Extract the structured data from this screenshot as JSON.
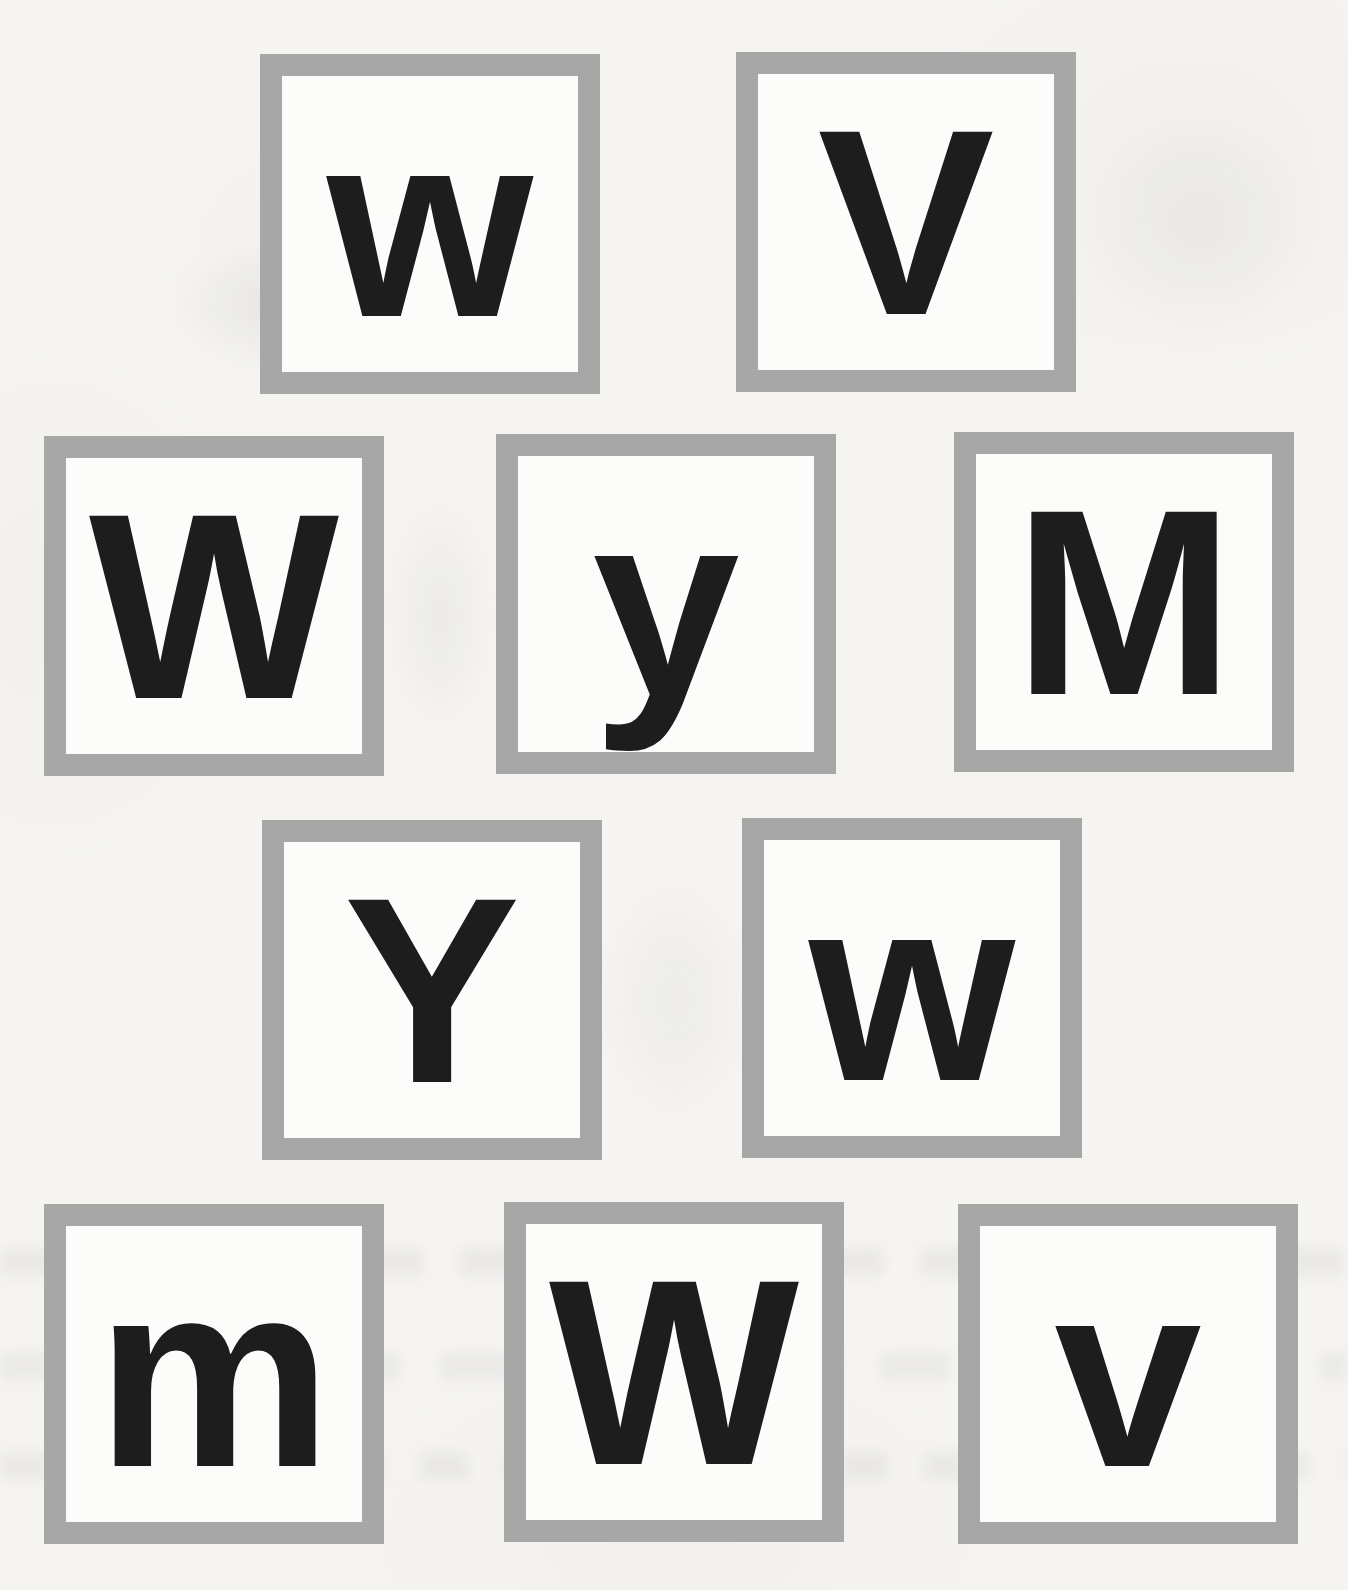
{
  "worksheet": {
    "colors": {
      "page_background": "#f5f4f1",
      "tile_border": "#a7a7a7",
      "tile_background": "#fcfcfa",
      "letter": "#1d1d1d"
    },
    "tiles": [
      {
        "letter": "w"
      },
      {
        "letter": "V"
      },
      {
        "letter": "W"
      },
      {
        "letter": "y"
      },
      {
        "letter": "M"
      },
      {
        "letter": "Y"
      },
      {
        "letter": "w"
      },
      {
        "letter": "m"
      },
      {
        "letter": "W"
      },
      {
        "letter": "v"
      }
    ]
  }
}
